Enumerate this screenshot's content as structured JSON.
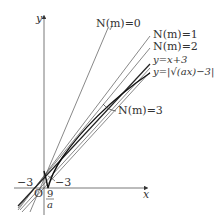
{
  "diagram": {
    "axes": {
      "x_label": "x",
      "y_label": "y",
      "origin_label": "O"
    },
    "tick_labels": {
      "neg_three_left": "−3",
      "neg_three_right": "−3",
      "nine_over_a_numerator": "9",
      "nine_over_a_denominator": "a"
    },
    "line_labels": {
      "n0": "N(m)=0",
      "n1": "N(m)=1",
      "n2": "N(m)=2",
      "n3": "N(m)=3",
      "line_yx3": "y=x+3",
      "curve": "y=|√(ax)−3|"
    },
    "colors": {
      "ink": "#333333",
      "curve": "#111111",
      "thin_line": "#555555"
    }
  }
}
